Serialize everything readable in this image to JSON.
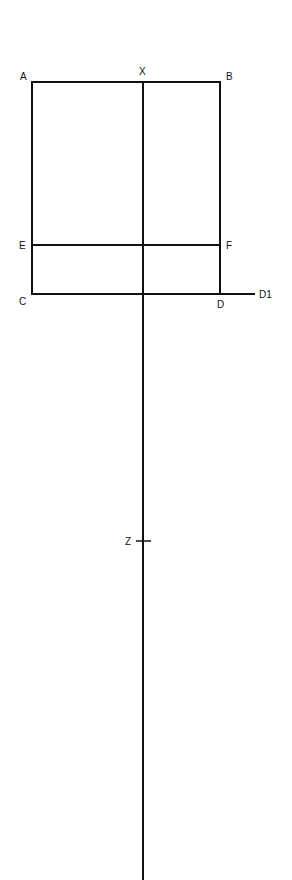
{
  "diagram": {
    "line_color": "#111111",
    "labels": {
      "A": "A",
      "B": "B",
      "X": "X",
      "E": "E",
      "F": "F",
      "C": "C",
      "D": "D",
      "D1": "D1",
      "Z": "Z"
    }
  }
}
